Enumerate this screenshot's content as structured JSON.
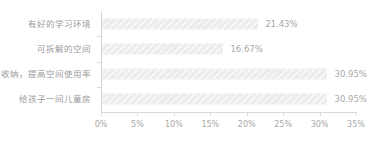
{
  "chart_data": {
    "type": "bar",
    "orientation": "horizontal",
    "title": "",
    "subtitle": "",
    "xlabel": "",
    "ylabel": "",
    "categories": [
      "有好的学习环境",
      "可拆解的空间",
      "有收纳，提高空间使用率",
      "给孩子一间儿童房"
    ],
    "values": [
      21.43,
      16.67,
      30.95,
      30.95
    ],
    "value_labels": [
      "21.43%",
      "16.67%",
      "30.95%",
      "30.95%"
    ],
    "xlim": [
      0,
      35
    ],
    "xtick_values": [
      0,
      5,
      10,
      15,
      20,
      25,
      30,
      35
    ],
    "xtick_labels": [
      "0%",
      "5%",
      "10%",
      "15%",
      "20%",
      "25%",
      "30%",
      "35%"
    ],
    "grid": false,
    "legend": null,
    "units": "percent"
  },
  "style": {
    "bar_color": "#ececec",
    "bar_hatch": "diagonal-stripes",
    "axis_color": "#d8d8d8",
    "tick_color": "#dcdcdc",
    "category_label_color": "#9b9b9b",
    "value_label_color": "#a8a8a8",
    "axis_label_color": "#a8a8a8",
    "background": "#ffffff"
  }
}
